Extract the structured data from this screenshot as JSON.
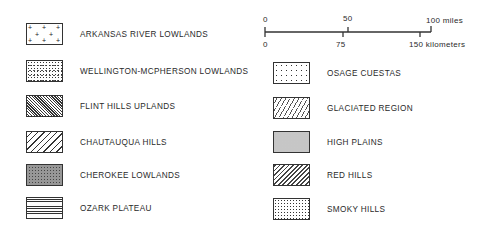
{
  "legend": {
    "left": [
      {
        "label": "ARKANSAS RIVER LOWLANDS",
        "pattern": "plus-signs"
      },
      {
        "label": "WELLINGTON-MCPHERSON LOWLANDS",
        "pattern": "sparse-dots"
      },
      {
        "label": "FLINT HILLS UPLANDS",
        "pattern": "dense-diagonal-hatch"
      },
      {
        "label": "CHAUTAUQUA HILLS",
        "pattern": "wide-diagonal-hatch"
      },
      {
        "label": "CHEROKEE LOWLANDS",
        "pattern": "dense-stipple"
      },
      {
        "label": "OZARK PLATEAU",
        "pattern": "horizontal-lines"
      }
    ],
    "right": [
      {
        "label": "OSAGE CUESTAS",
        "pattern": "scattered-ticks"
      },
      {
        "label": "GLACIATED REGION",
        "pattern": "dashed-diagonal"
      },
      {
        "label": "HIGH PLAINS",
        "pattern": "fine-stipple"
      },
      {
        "label": "RED HILLS",
        "pattern": "medium-diagonal-hatch"
      },
      {
        "label": "SMOKY HILLS",
        "pattern": "regular-dots"
      }
    ]
  },
  "scale": {
    "miles": {
      "start": "0",
      "mid": "50",
      "end": "100 miles"
    },
    "kilometers": {
      "start": "0",
      "mid": "75",
      "end": "150 kilometers"
    }
  }
}
